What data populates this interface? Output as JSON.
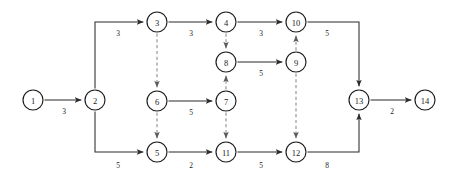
{
  "figure": {
    "type": "directed-network-graph",
    "background_color": "#ffffff",
    "node_fill": "#ffffff",
    "node_stroke": "#1c1c1c",
    "solid_edge_color": "#2a2a2a",
    "dashed_edge_color": "#8a8a8a",
    "width": 452,
    "height": 183
  },
  "chart_data": {
    "type": "diagram",
    "title": "",
    "nodes": [
      {
        "id": "1",
        "label": "1",
        "x": 33,
        "y": 100,
        "r": 10
      },
      {
        "id": "2",
        "label": "2",
        "x": 95,
        "y": 100,
        "r": 10
      },
      {
        "id": "3",
        "label": "3",
        "x": 157,
        "y": 22,
        "r": 10
      },
      {
        "id": "4",
        "label": "4",
        "x": 226,
        "y": 22,
        "r": 10
      },
      {
        "id": "5",
        "label": "5",
        "x": 157,
        "y": 152,
        "r": 10
      },
      {
        "id": "6",
        "label": "6",
        "x": 157,
        "y": 101,
        "r": 10
      },
      {
        "id": "7",
        "label": "7",
        "x": 226,
        "y": 101,
        "r": 10
      },
      {
        "id": "8",
        "label": "8",
        "x": 226,
        "y": 62,
        "r": 10
      },
      {
        "id": "9",
        "label": "9",
        "x": 296,
        "y": 62,
        "r": 10
      },
      {
        "id": "10",
        "label": "10",
        "x": 296,
        "y": 22,
        "r": 10
      },
      {
        "id": "11",
        "label": "11",
        "x": 226,
        "y": 152,
        "r": 10
      },
      {
        "id": "12",
        "label": "12",
        "x": 296,
        "y": 152,
        "r": 10
      },
      {
        "id": "13",
        "label": "13",
        "x": 359,
        "y": 100,
        "r": 10
      },
      {
        "id": "14",
        "label": "14",
        "x": 425,
        "y": 100,
        "r": 10
      }
    ],
    "edges": [
      {
        "id": "e1-2",
        "from": "1",
        "to": "2",
        "style": "solid",
        "weight": "3",
        "label_x": 64,
        "label_y": 111,
        "path": "h"
      },
      {
        "id": "e2-3",
        "from": "2",
        "to": "3",
        "style": "solid",
        "weight": "3",
        "label_x": 118,
        "label_y": 33,
        "path": "up-right"
      },
      {
        "id": "e3-4",
        "from": "3",
        "to": "4",
        "style": "solid",
        "weight": "3",
        "label_x": 191,
        "label_y": 33,
        "path": "h"
      },
      {
        "id": "e4-10",
        "from": "4",
        "to": "10",
        "style": "solid",
        "weight": "3",
        "label_x": 261,
        "label_y": 33,
        "path": "h"
      },
      {
        "id": "e10-13",
        "from": "10",
        "to": "13",
        "style": "solid",
        "weight": "5",
        "label_x": 327,
        "label_y": 33,
        "path": "right-down"
      },
      {
        "id": "e2-5",
        "from": "2",
        "to": "5",
        "style": "solid",
        "weight": "5",
        "label_x": 118,
        "label_y": 165,
        "path": "down-right"
      },
      {
        "id": "e5-11",
        "from": "5",
        "to": "11",
        "style": "solid",
        "weight": "2",
        "label_x": 191,
        "label_y": 165,
        "path": "h"
      },
      {
        "id": "e11-12",
        "from": "11",
        "to": "12",
        "style": "solid",
        "weight": "5",
        "label_x": 261,
        "label_y": 165,
        "path": "h"
      },
      {
        "id": "e12-13",
        "from": "12",
        "to": "13",
        "style": "solid",
        "weight": "8",
        "label_x": 327,
        "label_y": 165,
        "path": "right-up"
      },
      {
        "id": "e13-14",
        "from": "13",
        "to": "14",
        "style": "solid",
        "weight": "2",
        "label_x": 392,
        "label_y": 111,
        "path": "h"
      },
      {
        "id": "e6-7",
        "from": "6",
        "to": "7",
        "style": "solid",
        "weight": "5",
        "label_x": 191,
        "label_y": 112,
        "path": "h"
      },
      {
        "id": "e8-9",
        "from": "8",
        "to": "9",
        "style": "solid",
        "weight": "5",
        "label_x": 261,
        "label_y": 73,
        "path": "h"
      },
      {
        "id": "e3-6",
        "from": "3",
        "to": "6",
        "style": "dashed",
        "weight": "",
        "label_x": 0,
        "label_y": 0,
        "path": "v"
      },
      {
        "id": "e6-5",
        "from": "6",
        "to": "5",
        "style": "dashed",
        "weight": "",
        "label_x": 0,
        "label_y": 0,
        "path": "v"
      },
      {
        "id": "e4-8",
        "from": "4",
        "to": "8",
        "style": "dashed",
        "weight": "",
        "label_x": 0,
        "label_y": 0,
        "path": "v"
      },
      {
        "id": "e7-8",
        "from": "7",
        "to": "8",
        "style": "dashed",
        "weight": "",
        "label_x": 0,
        "label_y": 0,
        "path": "v"
      },
      {
        "id": "e7-11",
        "from": "7",
        "to": "11",
        "style": "dashed",
        "weight": "",
        "label_x": 0,
        "label_y": 0,
        "path": "v"
      },
      {
        "id": "e9-10",
        "from": "9",
        "to": "10",
        "style": "dashed",
        "weight": "",
        "label_x": 0,
        "label_y": 0,
        "path": "v"
      },
      {
        "id": "e9-12",
        "from": "9",
        "to": "12",
        "style": "dashed",
        "weight": "",
        "label_x": 0,
        "label_y": 0,
        "path": "v"
      }
    ]
  }
}
